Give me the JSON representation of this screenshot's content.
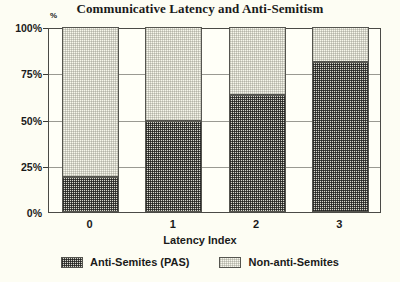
{
  "chart_data": {
    "type": "bar",
    "title": "Communicative Latency and Anti-Semitism",
    "xlabel": "Latency Index",
    "ylabel": "%",
    "categories": [
      "0",
      "1",
      "2",
      "3"
    ],
    "ylim": [
      0,
      100
    ],
    "ytick_labels": [
      "0%",
      "25%",
      "50%",
      "75%",
      "100%"
    ],
    "ytick_values": [
      0,
      25,
      50,
      75,
      100
    ],
    "grid": true,
    "stacked": true,
    "percent_stacked": true,
    "legend_position": "bottom",
    "series": [
      {
        "name": "Anti-Semites (PAS)",
        "fill": "dark-crosshatch",
        "color": "#3a3a36",
        "values": [
          19,
          49,
          63,
          81
        ]
      },
      {
        "name": "Non-anti-Semites",
        "fill": "light-stipple",
        "color": "#f2f2e6",
        "values": [
          81,
          51,
          37,
          19
        ]
      }
    ]
  },
  "axis": {
    "y_unit": "%",
    "x_title": "Latency Index"
  },
  "colors": {
    "background": "#fdfdf3",
    "plot_background": "#fffff7",
    "frame": "#4a4a46",
    "gridline": "#9a9a92",
    "text": "#1a1a1a"
  }
}
